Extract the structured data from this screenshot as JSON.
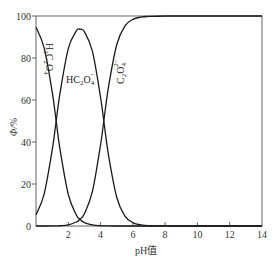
{
  "chart_data": {
    "type": "line",
    "title": "",
    "xlabel": "pH值",
    "ylabel": "Φ/%",
    "xlim": [
      0,
      14
    ],
    "ylim": [
      0,
      100
    ],
    "grid": false,
    "legend": "none (curves labeled inline)",
    "x_ticks": [
      "2",
      "4",
      "6",
      "8",
      "10",
      "12",
      "14"
    ],
    "y_ticks": [
      "0",
      "20",
      "40",
      "60",
      "80",
      "100"
    ],
    "annotations": [
      {
        "text": "H₂C₂O₄",
        "rotation": "vertical",
        "near_x": 1.2,
        "near_y": 75
      },
      {
        "text": "HC₂O₄⁻",
        "near_x": 3.6,
        "near_y": 69
      },
      {
        "text": "C₂O₄²⁻",
        "rotation": "vertical",
        "near_x": 5.3,
        "near_y": 80
      }
    ],
    "x": [
      0,
      0.5,
      1,
      1.25,
      1.5,
      2,
      2.5,
      2.7,
      3,
      3.5,
      4,
      4.2,
      4.5,
      5,
      5.5,
      6,
      6.5,
      7,
      8,
      10,
      12,
      14
    ],
    "series": [
      {
        "name": "H2C2O4",
        "values": [
          94.7,
          84.9,
          64.0,
          50.0,
          35.9,
          15.0,
          5.2,
          3.3,
          1.6,
          0.5,
          0.1,
          0.06,
          0.02,
          0,
          0,
          0,
          0,
          0,
          0,
          0,
          0,
          0
        ]
      },
      {
        "name": "HC2O4-",
        "values": [
          5.3,
          15.1,
          36.0,
          50.0,
          63.9,
          84.5,
          92.9,
          93.7,
          92.5,
          83.0,
          61.2,
          50.0,
          33.4,
          13.7,
          4.8,
          1.6,
          0.5,
          0.16,
          0.02,
          0,
          0,
          0
        ]
      },
      {
        "name": "C2O4 2-",
        "values": [
          0,
          0,
          0.02,
          0.06,
          0.13,
          0.53,
          1.9,
          3.0,
          5.8,
          16.6,
          38.7,
          50.0,
          66.6,
          86.3,
          95.2,
          98.4,
          99.5,
          99.8,
          100,
          100,
          100,
          100
        ]
      }
    ]
  },
  "labels": {
    "x_axis": "pH值",
    "y_axis": "Φ/%",
    "species": {
      "h2c2o4": {
        "main": "H",
        "sub1": "2",
        "mid": "C",
        "sub2": "2",
        "tail": "O",
        "sub3": "4"
      },
      "hc2o4": {
        "main": "HC",
        "sub1": "2",
        "mid": "O",
        "sub2": "4",
        "sup": "−"
      },
      "c2o4": {
        "main": "C",
        "sub1": "2",
        "mid": "O",
        "sub2": "4",
        "sup": "2−"
      }
    }
  },
  "ticks": {
    "x": [
      "2",
      "4",
      "6",
      "8",
      "10",
      "12",
      "14"
    ],
    "y": [
      "0",
      "20",
      "40",
      "60",
      "80",
      "100"
    ]
  }
}
